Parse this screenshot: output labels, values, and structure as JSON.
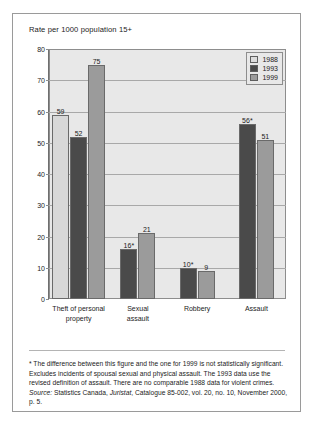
{
  "figure": {
    "title": "Rate per 1000 population 15+"
  },
  "chart_data": {
    "type": "bar",
    "title": "Rate per 1000 population 15+",
    "xlabel": "",
    "ylabel": "Rate per 1000 population 15+",
    "ylim": [
      0,
      80
    ],
    "yticks": [
      0,
      10,
      20,
      30,
      40,
      50,
      60,
      70,
      80
    ],
    "grid": true,
    "legend_position": "top-right",
    "categories": [
      "Theft of personal property",
      "Sexual assault",
      "Robbery",
      "Assault"
    ],
    "category_lines": [
      [
        "Theft of personal",
        "property"
      ],
      [
        "Sexual",
        "assault"
      ],
      [
        "Robbery"
      ],
      [
        "Assault"
      ]
    ],
    "series": [
      {
        "name": "1988",
        "color": "#d8d8d8",
        "values": [
          59,
          null,
          null,
          null
        ],
        "labels": [
          "59",
          "",
          "",
          ""
        ]
      },
      {
        "name": "1993",
        "color": "#4a4a4a",
        "values": [
          52,
          16,
          10,
          56
        ],
        "labels": [
          "52",
          "16*",
          "10*",
          "56*"
        ]
      },
      {
        "name": "1999",
        "color": "#9b9b9b",
        "values": [
          75,
          21,
          9,
          51
        ],
        "labels": [
          "75",
          "21",
          "9",
          "51"
        ]
      }
    ]
  },
  "legend": {
    "items": [
      {
        "label": "1988"
      },
      {
        "label": "1993"
      },
      {
        "label": "1999"
      }
    ]
  },
  "footnote": {
    "note": "* The difference between this figure and the one for 1999 is not statistically significant.  Excludes incidents of spousal sexual and physical assault. The 1993 data use the revised definition of assault. There are no comparable 1988 data for violent crimes.",
    "source_label": "Source:",
    "source_text_1": " Statistics Canada, ",
    "source_italic": "Juristat",
    "source_text_2": ", Catalogue 85-002, vol. 20, no. 10, November 2000, p. 5."
  }
}
